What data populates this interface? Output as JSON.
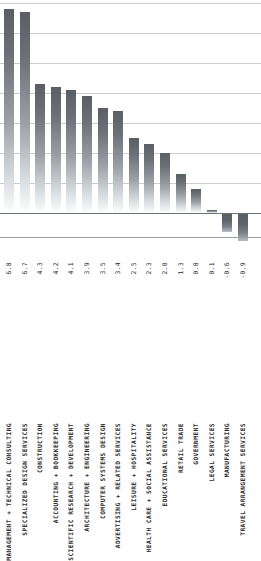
{
  "chart_data": {
    "type": "bar",
    "title": "",
    "subtitle": "",
    "xlabel": "",
    "ylabel": "",
    "orientation": "vertical",
    "grid": true,
    "legend": false,
    "value_labels_shown": true,
    "value_label_position": "below-axis",
    "ylim": [
      -1.0,
      7.0
    ],
    "gridline_values": [
      7.0,
      6.0,
      5.0,
      4.0,
      3.0,
      2.0,
      1.0
    ],
    "zero_line": 0.0,
    "categories": [
      "MANAGEMENT + TECHNICAL CONSULTING",
      "SPECIALIZED DESIGN SERVICES",
      "CONSTRUCTION",
      "ACCOUNTING + BOOKKEEPING",
      "SCIENTIFIC RESEARCH + DEVELOPMENT",
      "ARCHITECTURE + ENGINEERING",
      "COMPUTER SYSTEMS DESIGN",
      "ADVERTISING + RELATED SERVICES",
      "LEISURE + HOSPITALITY",
      "HEALTH CARE + SOCIAL ASSISTANCE",
      "EDUCATIONAL SERVICES",
      "RETAIL TRADE",
      "GOVERNMENT",
      "LEGAL SERVICES",
      "MANUFACTURING",
      "TRAVEL ARRANGEMENT SERVICES"
    ],
    "values": [
      6.8,
      6.7,
      4.3,
      4.2,
      4.1,
      3.9,
      3.5,
      3.4,
      2.5,
      2.3,
      2.0,
      1.3,
      0.8,
      0.1,
      -0.6,
      -0.9
    ],
    "value_labels": [
      "6.8",
      "6.7",
      "4.3",
      "4.2",
      "4.1",
      "3.9",
      "3.5",
      "3.4",
      "2.5",
      "2.3",
      "2.0",
      "1.3",
      "0.8",
      "0.1",
      "-0.6",
      "-0.9"
    ],
    "colors": {
      "bar_top": "#5a5f66",
      "bar_bottom": "#ffffff",
      "gridline": "#c9cdd2",
      "zero_line": "#6e7378",
      "text": "#2b2e31",
      "background": "#ffffff"
    }
  }
}
